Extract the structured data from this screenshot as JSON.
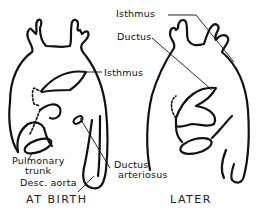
{
  "diagram": {
    "panels": [
      {
        "caption": "AT BIRTH",
        "labels": {
          "isthmus": "Isthmus",
          "pulmonary_trunk_line1": "Pulmonary",
          "pulmonary_trunk_line2": "trunk",
          "desc_aorta": "Desc. aorta"
        }
      },
      {
        "caption": "LATER",
        "labels": {
          "isthmus": "Isthmus",
          "ductus": "Ductus"
        }
      }
    ],
    "shared_labels": {
      "ductus_arteriosus_line1": "Ductus",
      "ductus_arteriosus_line2": "arteriosus"
    },
    "colors": {
      "stroke": "#111111",
      "background": "#ffffff"
    }
  }
}
